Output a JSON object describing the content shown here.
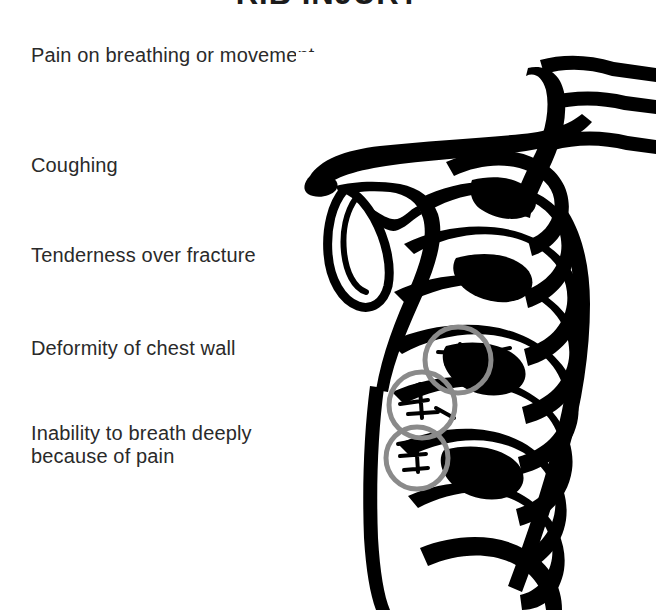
{
  "page": {
    "background_color": "#ffffff",
    "width": 656,
    "height": 610
  },
  "header": {
    "title": "RIB INJURY",
    "note": "title is cropped at the top edge of the frame; only the lower tips of the letters are visible",
    "color": "#1b1b1b"
  },
  "symptoms": {
    "text_color": "#2a2a2a",
    "items": [
      {
        "label": "Pain on breathing or movement"
      },
      {
        "label": "Coughing"
      },
      {
        "label": "Tenderness over fracture"
      },
      {
        "label": "Deformity of chest wall"
      },
      {
        "label": "Inability to breath deeply\nbecause of pain"
      }
    ]
  },
  "illustration": {
    "name": "rib-cage-line-drawing",
    "description": "High contrast black and white line drawing of a human rib cage in three-quarter view, showing clavicle, scapula, sternum and ribs",
    "ink_color": "#000000",
    "paper_color": "#ffffff",
    "fracture_markers": {
      "stroke_color": "#8a8a8a",
      "circles": [
        {
          "label": "fracture-site-upper",
          "cx": 162,
          "cy": 308,
          "r": 33
        },
        {
          "label": "fracture-site-middle",
          "cx": 126,
          "cy": 353,
          "r": 33
        },
        {
          "label": "fracture-site-lower",
          "cx": 121,
          "cy": 406,
          "r": 31
        }
      ]
    }
  }
}
